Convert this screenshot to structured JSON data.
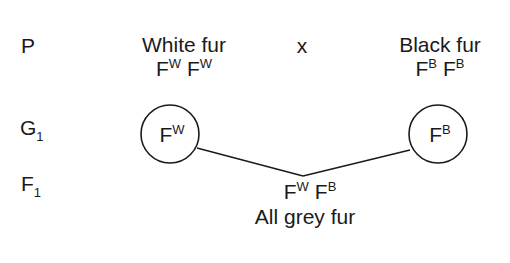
{
  "rows": {
    "parents_label": "P",
    "gametes_label": "G",
    "gametes_sub": "1",
    "f1_label": "F",
    "f1_sub": "1"
  },
  "parents": {
    "left": {
      "phenotype": "White fur",
      "allele_base": "F",
      "allele_sup": "W"
    },
    "cross_symbol": "x",
    "right": {
      "phenotype": "Black fur",
      "allele_base": "F",
      "allele_sup": "B"
    }
  },
  "gametes": {
    "left": {
      "base": "F",
      "sup": "W"
    },
    "right": {
      "base": "F",
      "sup": "B"
    }
  },
  "offspring": {
    "genotype": [
      {
        "base": "F",
        "sup": "W"
      },
      {
        "base": "F",
        "sup": "B"
      }
    ],
    "phenotype": "All grey fur"
  },
  "colors": {
    "ink": "#1a1a1a",
    "background": "#ffffff"
  }
}
